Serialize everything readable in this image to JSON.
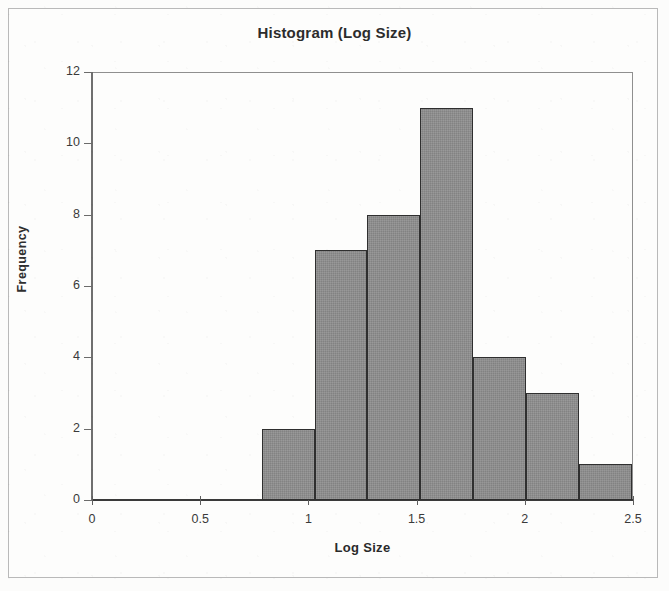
{
  "chart_data": {
    "type": "bar",
    "title": "Histogram (Log Size)",
    "xlabel": "Log Size",
    "ylabel": "Frequency",
    "xlim": [
      0,
      2.5
    ],
    "ylim": [
      0,
      12
    ],
    "grid": false,
    "legend": null,
    "bin_width": 0.244,
    "bin_edges": [
      0.785,
      1.029,
      1.273,
      1.518,
      1.762,
      2.006,
      2.25,
      2.494
    ],
    "categories": [
      "0.79-1.03",
      "1.03-1.27",
      "1.27-1.52",
      "1.52-1.76",
      "1.76-2.01",
      "2.01-2.25",
      "2.25-2.49"
    ],
    "values": [
      2,
      7,
      8,
      11,
      4,
      3,
      1
    ],
    "x_ticks": [
      0,
      0.5,
      1,
      1.5,
      2,
      2.5
    ],
    "x_tick_labels": [
      "0",
      "0.5",
      "1",
      "1.5",
      "2",
      "2.5"
    ],
    "y_ticks": [
      0,
      2,
      4,
      6,
      8,
      10,
      12
    ],
    "y_tick_labels": [
      "0",
      "2",
      "4",
      "6",
      "8",
      "10",
      "12"
    ],
    "bar_fill_color": "#8e8e8e",
    "bar_border_color": "#2f2f2f",
    "axis_color": "#3a3a3a",
    "background_color": "#fdfdfc"
  }
}
